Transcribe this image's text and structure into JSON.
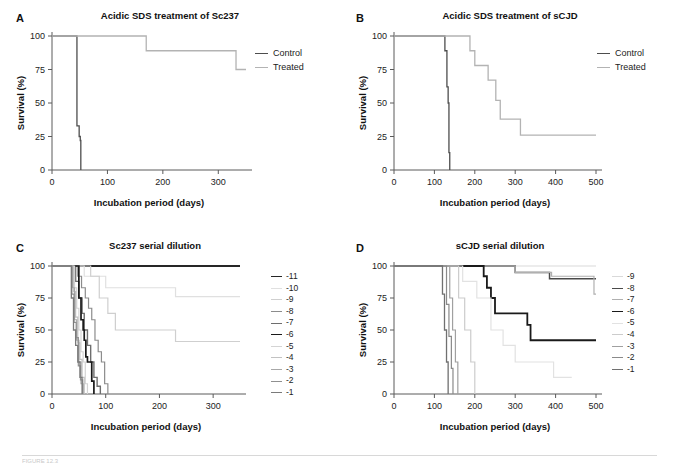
{
  "figure": {
    "width": 679,
    "height": 466,
    "caption": "FIGURE 12.3"
  },
  "axis": {
    "x_title": "Incubation period (days)",
    "y_title": "Survival (%)",
    "y_ticks": [
      "0",
      "25",
      "50",
      "75",
      "100"
    ],
    "y_values": [
      0,
      25,
      50,
      75,
      100
    ]
  },
  "colors": {
    "control": "#4d4d4d",
    "treated": "#b3b3b3",
    "axis": "#5a5a5a",
    "text": "#1a1a1a",
    "d_minus11": "#262626",
    "d_minus10": "#e0e0e0",
    "d_minus9": "#cfcfcf",
    "d_minus8": "#8c8c8c",
    "d_minus7": "#6e6e6e",
    "d_minus6": "#1a1a1a",
    "d_minus5": "#d4d4d4",
    "d_minus4": "#c2c2c2",
    "d_minus3": "#a8a8a8",
    "d_minus2": "#909090",
    "d_minus1": "#7a7a7a"
  },
  "panels": {
    "A": {
      "letter": "A",
      "title": "Acidic SDS treatment of Sc237",
      "x_ticks": [
        "0",
        "100",
        "200",
        "300"
      ],
      "x_values": [
        0,
        100,
        200,
        300
      ],
      "x_max": 350,
      "legend": [
        {
          "label": "Control",
          "color": "#4d4d4d",
          "width": 1.3
        },
        {
          "label": "Treated",
          "color": "#b3b3b3",
          "width": 1.3
        }
      ]
    },
    "B": {
      "letter": "B",
      "title": "Acidic SDS treatment of sCJD",
      "x_ticks": [
        "0",
        "100",
        "200",
        "300",
        "400",
        "500"
      ],
      "x_values": [
        0,
        100,
        200,
        300,
        400,
        500
      ],
      "x_max": 500,
      "legend": [
        {
          "label": "Control",
          "color": "#4d4d4d",
          "width": 1.3
        },
        {
          "label": "Treated",
          "color": "#b3b3b3",
          "width": 1.3
        }
      ]
    },
    "C": {
      "letter": "C",
      "title": "Sc237 serial dilution",
      "x_ticks": [
        "0",
        "100",
        "200",
        "300"
      ],
      "x_values": [
        0,
        100,
        200,
        300
      ],
      "x_max": 350,
      "legend": [
        {
          "label": "-11",
          "color": "#262626",
          "width": 1.9
        },
        {
          "label": "-10",
          "color": "#e0e0e0",
          "width": 1.2
        },
        {
          "label": "-9",
          "color": "#cfcfcf",
          "width": 1.2
        },
        {
          "label": "-8",
          "color": "#8c8c8c",
          "width": 1.2
        },
        {
          "label": "-7",
          "color": "#6e6e6e",
          "width": 1.4
        },
        {
          "label": "-6",
          "color": "#1a1a1a",
          "width": 1.7
        },
        {
          "label": "-5",
          "color": "#d4d4d4",
          "width": 1.2
        },
        {
          "label": "-4",
          "color": "#c2c2c2",
          "width": 1.2
        },
        {
          "label": "-3",
          "color": "#a8a8a8",
          "width": 1.2
        },
        {
          "label": "-2",
          "color": "#909090",
          "width": 1.2
        },
        {
          "label": "-1",
          "color": "#7a7a7a",
          "width": 1.3
        }
      ]
    },
    "D": {
      "letter": "D",
      "title": "sCJD serial dilution",
      "x_ticks": [
        "0",
        "100",
        "200",
        "300",
        "400",
        "500"
      ],
      "x_values": [
        0,
        100,
        200,
        300,
        400,
        500
      ],
      "x_max": 500,
      "legend": [
        {
          "label": "-9",
          "color": "#d9d9d9",
          "width": 1.2
        },
        {
          "label": "-8",
          "color": "#4a4a4a",
          "width": 1.5
        },
        {
          "label": "-7",
          "color": "#b0b0b0",
          "width": 1.2
        },
        {
          "label": "-6",
          "color": "#1a1a1a",
          "width": 1.8
        },
        {
          "label": "-5",
          "color": "#e2e2e2",
          "width": 1.2
        },
        {
          "label": "-4",
          "color": "#cccccc",
          "width": 1.2
        },
        {
          "label": "-3",
          "color": "#a0a0a0",
          "width": 1.2
        },
        {
          "label": "-2",
          "color": "#8a8a8a",
          "width": 1.2
        },
        {
          "label": "-1",
          "color": "#707070",
          "width": 1.3
        }
      ]
    }
  },
  "chart_data": [
    {
      "panel": "A",
      "type": "line",
      "title": "Acidic SDS treatment of Sc237",
      "xlabel": "Incubation period (days)",
      "ylabel": "Survival (%)",
      "xlim": [
        0,
        350
      ],
      "ylim": [
        0,
        100
      ],
      "grid": false,
      "legend_position": "right",
      "series": [
        {
          "name": "Control",
          "color": "#4d4d4d",
          "x": [
            0,
            45,
            45,
            49,
            49,
            51,
            51,
            52,
            52
          ],
          "y": [
            100,
            100,
            33,
            33,
            25,
            25,
            22,
            22,
            0
          ]
        },
        {
          "name": "Treated",
          "color": "#b3b3b3",
          "x": [
            0,
            170,
            170,
            332,
            332,
            350
          ],
          "y": [
            100,
            100,
            89,
            89,
            75,
            75
          ]
        }
      ]
    },
    {
      "panel": "B",
      "type": "line",
      "title": "Acidic SDS treatment of sCJD",
      "xlabel": "Incubation period (days)",
      "ylabel": "Survival (%)",
      "xlim": [
        0,
        500
      ],
      "ylim": [
        0,
        100
      ],
      "grid": false,
      "legend_position": "right",
      "series": [
        {
          "name": "Control",
          "color": "#4d4d4d",
          "x": [
            0,
            126,
            126,
            131,
            131,
            134,
            134,
            136,
            136,
            138,
            138
          ],
          "y": [
            100,
            100,
            89,
            89,
            62,
            62,
            50,
            50,
            13,
            13,
            0
          ]
        },
        {
          "name": "Treated",
          "color": "#b3b3b3",
          "x": [
            0,
            188,
            188,
            200,
            200,
            233,
            233,
            252,
            252,
            263,
            263,
            313,
            313,
            500
          ],
          "y": [
            100,
            100,
            89,
            89,
            78,
            78,
            67,
            67,
            52,
            52,
            38,
            38,
            26,
            26
          ]
        }
      ]
    },
    {
      "panel": "C",
      "type": "line",
      "title": "Sc237 serial dilution",
      "xlabel": "Incubation period (days)",
      "ylabel": "Survival (%)",
      "xlim": [
        0,
        350
      ],
      "ylim": [
        0,
        100
      ],
      "grid": false,
      "legend_position": "right",
      "series": [
        {
          "name": "-11",
          "color": "#262626",
          "x": [
            0,
            350
          ],
          "y": [
            100,
            100
          ]
        },
        {
          "name": "-10",
          "color": "#e0e0e0",
          "x": [
            0,
            60,
            60,
            100,
            100,
            230,
            230,
            350
          ],
          "y": [
            100,
            100,
            92,
            92,
            83,
            83,
            76,
            76
          ]
        },
        {
          "name": "-9",
          "color": "#cfcfcf",
          "x": [
            0,
            72,
            72,
            88,
            88,
            104,
            104,
            118,
            118,
            230,
            230,
            350
          ],
          "y": [
            100,
            100,
            92,
            92,
            75,
            75,
            63,
            63,
            50,
            50,
            41,
            41
          ]
        },
        {
          "name": "-8",
          "color": "#8c8c8c",
          "x": [
            0,
            48,
            48,
            55,
            55,
            62,
            62,
            68,
            68,
            74,
            74,
            80,
            80,
            86,
            86,
            92,
            92,
            98,
            98,
            104,
            104
          ],
          "y": [
            100,
            100,
            92,
            92,
            83,
            83,
            75,
            75,
            67,
            67,
            58,
            58,
            42,
            42,
            33,
            33,
            25,
            25,
            8,
            8,
            0
          ]
        },
        {
          "name": "-7",
          "color": "#6e6e6e",
          "x": [
            0,
            44,
            44,
            50,
            50,
            56,
            56,
            60,
            60,
            66,
            66,
            72,
            72,
            78,
            78,
            84,
            84,
            90,
            90
          ],
          "y": [
            100,
            100,
            88,
            88,
            75,
            75,
            63,
            63,
            50,
            50,
            38,
            38,
            25,
            25,
            13,
            13,
            6,
            6,
            0
          ]
        },
        {
          "name": "-6",
          "color": "#1a1a1a",
          "x": [
            0,
            50,
            50,
            54,
            54,
            58,
            58,
            60,
            60,
            63,
            63,
            66,
            66,
            70,
            70,
            74,
            74,
            78,
            78
          ],
          "y": [
            100,
            100,
            75,
            75,
            58,
            58,
            50,
            50,
            42,
            42,
            29,
            29,
            25,
            25,
            25,
            25,
            10,
            10,
            0
          ]
        },
        {
          "name": "-5",
          "color": "#d4d4d4",
          "x": [
            0,
            42,
            42,
            46,
            46,
            50,
            50,
            54,
            54,
            58,
            58,
            62,
            62,
            66,
            66
          ],
          "y": [
            100,
            100,
            83,
            83,
            67,
            67,
            50,
            50,
            33,
            33,
            25,
            25,
            8,
            8,
            0
          ]
        },
        {
          "name": "-4",
          "color": "#c2c2c2",
          "x": [
            0,
            40,
            40,
            44,
            44,
            48,
            48,
            52,
            52,
            56,
            56,
            60,
            60
          ],
          "y": [
            100,
            100,
            80,
            80,
            60,
            60,
            40,
            40,
            27,
            27,
            13,
            13,
            0
          ]
        },
        {
          "name": "-3",
          "color": "#a8a8a8",
          "x": [
            0,
            38,
            38,
            42,
            42,
            46,
            46,
            50,
            50,
            54,
            54,
            58,
            58
          ],
          "y": [
            100,
            100,
            83,
            83,
            58,
            58,
            42,
            42,
            25,
            25,
            8,
            8,
            0
          ]
        },
        {
          "name": "-2",
          "color": "#909090",
          "x": [
            0,
            37,
            37,
            41,
            41,
            45,
            45,
            49,
            49,
            53,
            53,
            57,
            57
          ],
          "y": [
            100,
            100,
            78,
            78,
            56,
            56,
            44,
            44,
            22,
            22,
            11,
            11,
            0
          ]
        },
        {
          "name": "-1",
          "color": "#7a7a7a",
          "x": [
            0,
            36,
            36,
            40,
            40,
            44,
            44,
            48,
            48,
            52,
            52,
            56,
            56
          ],
          "y": [
            100,
            100,
            75,
            75,
            50,
            50,
            38,
            38,
            25,
            25,
            13,
            13,
            0
          ]
        }
      ]
    },
    {
      "panel": "D",
      "type": "line",
      "title": "sCJD serial dilution",
      "xlabel": "Incubation period (days)",
      "ylabel": "Survival (%)",
      "xlim": [
        0,
        500
      ],
      "ylim": [
        0,
        100
      ],
      "grid": false,
      "legend_position": "right",
      "series": [
        {
          "name": "-9",
          "color": "#d9d9d9",
          "x": [
            0,
            500
          ],
          "y": [
            100,
            100
          ]
        },
        {
          "name": "-8",
          "color": "#4a4a4a",
          "x": [
            0,
            300,
            300,
            385,
            385,
            500
          ],
          "y": [
            100,
            100,
            95,
            95,
            90,
            90
          ]
        },
        {
          "name": "-7",
          "color": "#b0b0b0",
          "x": [
            0,
            300,
            300,
            390,
            390,
            495,
            495,
            500
          ],
          "y": [
            100,
            100,
            95,
            95,
            92,
            92,
            78,
            78
          ]
        },
        {
          "name": "-6",
          "color": "#1a1a1a",
          "x": [
            0,
            222,
            222,
            230,
            230,
            240,
            240,
            250,
            250,
            330,
            330,
            338,
            338,
            500
          ],
          "y": [
            100,
            100,
            92,
            92,
            83,
            83,
            75,
            75,
            63,
            63,
            54,
            54,
            42,
            42
          ]
        },
        {
          "name": "-5",
          "color": "#e2e2e2",
          "x": [
            0,
            170,
            170,
            205,
            205,
            240,
            240,
            270,
            270,
            300,
            300,
            340,
            340,
            395,
            395,
            440,
            440
          ],
          "y": [
            100,
            100,
            88,
            88,
            75,
            75,
            50,
            50,
            38,
            38,
            25,
            25,
            25,
            25,
            13,
            13,
            13
          ]
        },
        {
          "name": "-4",
          "color": "#cccccc",
          "x": [
            0,
            160,
            160,
            175,
            175,
            190,
            190,
            200,
            200
          ],
          "y": [
            100,
            100,
            75,
            75,
            50,
            50,
            25,
            25,
            0
          ]
        },
        {
          "name": "-3",
          "color": "#a0a0a0",
          "x": [
            0,
            138,
            138,
            145,
            145,
            152,
            152,
            158,
            158
          ],
          "y": [
            100,
            100,
            75,
            75,
            50,
            50,
            25,
            25,
            0
          ]
        },
        {
          "name": "-2",
          "color": "#8a8a8a",
          "x": [
            0,
            130,
            130,
            136,
            136,
            142,
            142,
            146,
            146
          ],
          "y": [
            100,
            100,
            70,
            70,
            45,
            45,
            20,
            20,
            0
          ]
        },
        {
          "name": "-1",
          "color": "#707070",
          "x": [
            0,
            120,
            120,
            125,
            125,
            130,
            130,
            134,
            134
          ],
          "y": [
            100,
            100,
            78,
            78,
            50,
            50,
            25,
            25,
            0
          ]
        }
      ]
    }
  ]
}
